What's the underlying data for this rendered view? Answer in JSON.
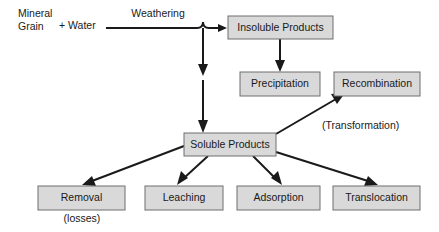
{
  "diagram": {
    "background_color": "#ffffff",
    "box_fill_color": "#d9d9d9",
    "box_border_color": "#6e6e6e",
    "line_color": "#1a1a1a",
    "text_color": "#1a1a1a",
    "source_labels": {
      "mineral_line1": "Mineral",
      "mineral_line2": "Grain",
      "plus_water": "+ Water"
    },
    "edge_labels": {
      "weathering": "Weathering",
      "transformation": "(Transformation)",
      "losses": "(losses)"
    },
    "nodes": [
      {
        "id": "insoluble-products",
        "label": "Insoluble Products"
      },
      {
        "id": "precipitation",
        "label": "Precipitation"
      },
      {
        "id": "recombination",
        "label": "Recombination"
      },
      {
        "id": "soluble-products",
        "label": "Soluble Products"
      },
      {
        "id": "removal",
        "label": "Removal"
      },
      {
        "id": "leaching",
        "label": "Leaching"
      },
      {
        "id": "adsorption",
        "label": "Adsorption"
      },
      {
        "id": "translocation",
        "label": "Translocation"
      }
    ]
  }
}
